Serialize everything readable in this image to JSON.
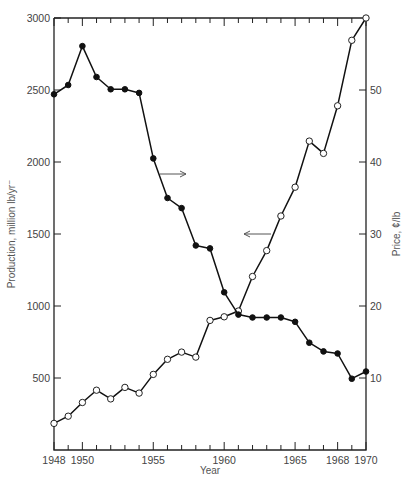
{
  "chart_data": {
    "type": "line",
    "title": "",
    "xlabel": "Year",
    "ylabel_left": "Production, million lb/yr",
    "ylabel_right": "Price, ¢/lb",
    "x": [
      1948,
      1949,
      1950,
      1951,
      1952,
      1953,
      1954,
      1955,
      1956,
      1957,
      1958,
      1959,
      1960,
      1961,
      1962,
      1963,
      1964,
      1965,
      1966,
      1967,
      1968,
      1969,
      1970
    ],
    "x_tick_labels": [
      "1948",
      "1950",
      "1955",
      "1960",
      "1965",
      "1968",
      "1970"
    ],
    "x_ticks": [
      1948,
      1950,
      1955,
      1960,
      1965,
      1968,
      1970
    ],
    "xlim": [
      1948,
      1970
    ],
    "y_left_ticks": [
      500,
      1000,
      1500,
      2000,
      2500,
      3000
    ],
    "y_left_lim": [
      0,
      3000
    ],
    "y_right_ticks": [
      10,
      20,
      30,
      40,
      50
    ],
    "y_right_lim": [
      0,
      60
    ],
    "grid": false,
    "series": [
      {
        "name": "Production",
        "axis": "left",
        "marker": "open-circle",
        "values": [
          185,
          235,
          330,
          415,
          355,
          435,
          395,
          525,
          630,
          680,
          645,
          900,
          925,
          965,
          1205,
          1385,
          1625,
          1825,
          2145,
          2060,
          2390,
          2845,
          3000
        ]
      },
      {
        "name": "Price",
        "axis": "right",
        "marker": "filled-circle",
        "values": [
          49.4,
          50.7,
          56.1,
          51.8,
          50.1,
          50.1,
          49.6,
          40.5,
          35.0,
          33.6,
          28.4,
          28.0,
          21.9,
          18.8,
          18.4,
          18.4,
          18.4,
          17.8,
          14.9,
          13.7,
          13.4,
          9.9,
          10.9
        ]
      }
    ],
    "annotations": [
      {
        "type": "arrow",
        "direction": "right",
        "near_series": "Price",
        "meaning": "read against right axis"
      },
      {
        "type": "arrow",
        "direction": "left",
        "near_series": "Production",
        "meaning": "read against left axis"
      }
    ]
  },
  "labels": {
    "xlabel": "Year",
    "ylabel_left": "Production, million lb/yr⁻",
    "ylabel_right": "Price, ¢/lb"
  }
}
